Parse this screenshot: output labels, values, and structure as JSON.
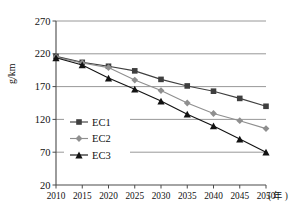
{
  "chart_data": {
    "type": "line",
    "title": "",
    "xlabel": "年",
    "ylabel": "g/km",
    "x": [
      2010,
      2015,
      2020,
      2025,
      2030,
      2035,
      2040,
      2045,
      2050
    ],
    "xtick_labels": [
      "2010",
      "2015",
      "2020",
      "2025",
      "2030",
      "2035",
      "2040",
      "2045",
      "2050"
    ],
    "ytick_labels": [
      "20",
      "70",
      "120",
      "170",
      "220",
      "270"
    ],
    "yticks": [
      20,
      70,
      120,
      170,
      220,
      270
    ],
    "ylim": [
      20,
      270
    ],
    "xlim": [
      2010,
      2050
    ],
    "grid": "horizontal",
    "legend_position": "inside-lower-left",
    "series": [
      {
        "name": "EC1",
        "marker": "square",
        "color": "#3f3f3f",
        "values": [
          216,
          207,
          201,
          194,
          181,
          171,
          163,
          152,
          140
        ]
      },
      {
        "name": "EC2",
        "marker": "diamond",
        "color": "#8f8f8f",
        "values": [
          215,
          206,
          199,
          180,
          164,
          145,
          129,
          118,
          106
        ]
      },
      {
        "name": "EC3",
        "marker": "triangle",
        "color": "#121212",
        "values": [
          214,
          203,
          183,
          166,
          148,
          128,
          110,
          90,
          70
        ]
      }
    ]
  },
  "axis": {
    "y_title": "g/km",
    "x_unit": "( 年 )"
  },
  "legend": {
    "items": [
      {
        "label": "EC1"
      },
      {
        "label": "EC2"
      },
      {
        "label": "EC3"
      }
    ]
  }
}
